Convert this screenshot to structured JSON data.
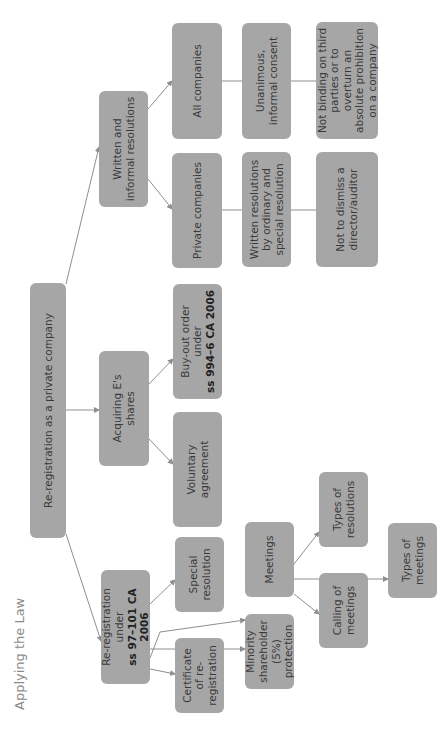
{
  "section_title": "Applying the Law",
  "root": {
    "label": "Re-registration as a private company"
  },
  "branches": {
    "written": {
      "label": "Written and informal resolutions"
    },
    "acquiring": {
      "label": "Acquiring E's shares"
    },
    "rereg": {
      "label_prefix": "Re-registration under",
      "label_bold": "ss 97–101 CA 2006"
    }
  },
  "written_children": {
    "all_companies": "All companies",
    "private_companies": "Private companies",
    "unanimous": "Unanimous, informal consent",
    "written_res": "Written resolutions by ordinary and special resolution",
    "not_binding": "Not binding on third parties or to overturn an absolute prohibition on a company",
    "not_dismiss": "Not to dismiss a director/auditor"
  },
  "acquiring_children": {
    "buyout_prefix": "Buy-out order under",
    "buyout_bold": "ss 994–6 CA 2006",
    "voluntary": "Voluntary agreement"
  },
  "rereg_children": {
    "special": "Special resolution",
    "certificate": "Certificate of re-registration",
    "meetings": "Meetings",
    "minority": "Minority shareholder (5%) protection"
  },
  "meetings_children": {
    "types_resolutions": "Types of resolutions",
    "calling": "Calling of meetings",
    "types_meetings": "Types of meetings"
  },
  "colors": {
    "box": "#a6a6a6",
    "text": "#3a3a3a",
    "line": "#8f8f8f",
    "title": "#8a8a8a"
  }
}
